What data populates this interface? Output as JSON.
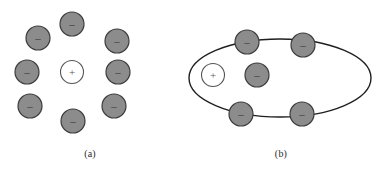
{
  "figure": {
    "background_color": "#ffffff",
    "panels": [
      {
        "id": "a",
        "caption": "(a)",
        "description": "Single positive charge surrounded by a ring of eight negative charges",
        "center_charge": {
          "sign": "+",
          "symbol": "+",
          "fill": "#ffffff",
          "stroke": "#4d4d4d",
          "cx": 72,
          "cy": 72,
          "r": 11.5
        },
        "ring_charges": [
          {
            "sign": "-",
            "symbol": "–",
            "cx": 72,
            "cy": 24,
            "r": 12
          },
          {
            "sign": "-",
            "symbol": "–",
            "cx": 117,
            "cy": 41,
            "r": 12
          },
          {
            "sign": "-",
            "symbol": "–",
            "cx": 118,
            "cy": 72,
            "r": 12
          },
          {
            "sign": "-",
            "symbol": "–",
            "cx": 114,
            "cy": 106,
            "r": 12
          },
          {
            "sign": "-",
            "symbol": "–",
            "cx": 73,
            "cy": 121,
            "r": 12
          },
          {
            "sign": "-",
            "symbol": "–",
            "cx": 30,
            "cy": 106,
            "r": 12
          },
          {
            "sign": "-",
            "symbol": "–",
            "cx": 27,
            "cy": 72,
            "r": 12
          },
          {
            "sign": "-",
            "symbol": "–",
            "cx": 38,
            "cy": 38,
            "r": 12
          }
        ]
      },
      {
        "id": "b",
        "caption": "(b)",
        "description": "Elliptical orbit containing one positive charge and five negative charges",
        "orbit": {
          "shape": "ellipse",
          "cx": 100,
          "cy": 78,
          "rx": 91,
          "ry": 39,
          "stroke": "#1f1f1f",
          "stroke_width": 1.4,
          "fill": "none"
        },
        "center_charge": {
          "sign": "+",
          "symbol": "+",
          "fill": "#ffffff",
          "stroke": "#4d4d4d",
          "cx": 33,
          "cy": 75,
          "r": 11.5
        },
        "ring_charges": [
          {
            "sign": "-",
            "symbol": "–",
            "cx": 67,
            "cy": 42,
            "r": 12
          },
          {
            "sign": "-",
            "symbol": "–",
            "cx": 123,
            "cy": 45,
            "r": 12
          },
          {
            "sign": "-",
            "symbol": "–",
            "cx": 77,
            "cy": 75,
            "r": 12
          },
          {
            "sign": "-",
            "symbol": "–",
            "cx": 61,
            "cy": 114,
            "r": 12
          },
          {
            "sign": "-",
            "symbol": "–",
            "cx": 122,
            "cy": 114,
            "r": 12
          }
        ]
      }
    ]
  },
  "style": {
    "negative_fill": "#8c8c8c",
    "negative_stroke": "#3d3d3d",
    "negative_glyph_color": "#333333",
    "positive_fill": "#ffffff",
    "positive_stroke": "#555555",
    "positive_glyph_color": "#555555",
    "caption_color": "#2b2b2b"
  },
  "labels": {
    "caption_a": "(a)",
    "caption_b": "(b)",
    "positive_symbol": "+",
    "negative_symbol": "–"
  }
}
